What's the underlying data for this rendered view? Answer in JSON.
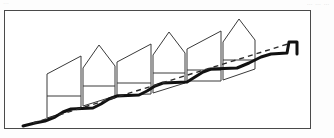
{
  "page": {
    "header_note": "…  … …",
    "corner_mark": "…",
    "background_color": "#fdfdfd"
  },
  "figure": {
    "frame": {
      "x": 4,
      "y": 10,
      "width": 307,
      "height": 119,
      "border_color": "#4a4a4a",
      "border_width": 1,
      "fill": "#ffffff"
    },
    "colors": {
      "outline": "#3a3a3a",
      "terrain": "#111111",
      "dashed_line": "#2b2b2b",
      "fill": "#ffffff"
    },
    "terrain": {
      "name": "ground-profile",
      "description": "Stepped hillside rising from lower-left to upper-right",
      "stroke_width": 3,
      "points": [
        [
          18,
          115
        ],
        [
          30,
          112
        ],
        [
          40,
          110
        ],
        [
          50,
          106
        ],
        [
          58,
          101
        ],
        [
          66,
          98
        ],
        [
          88,
          97
        ],
        [
          96,
          93
        ],
        [
          104,
          88
        ],
        [
          112,
          85
        ],
        [
          134,
          84
        ],
        [
          142,
          80
        ],
        [
          150,
          75
        ],
        [
          158,
          72
        ],
        [
          182,
          71
        ],
        [
          190,
          66
        ],
        [
          198,
          61
        ],
        [
          206,
          58
        ],
        [
          232,
          57
        ],
        [
          244,
          52
        ],
        [
          256,
          46
        ],
        [
          266,
          43
        ],
        [
          282,
          42
        ],
        [
          284,
          31
        ],
        [
          292,
          31
        ],
        [
          292,
          43
        ]
      ]
    },
    "trend_line": {
      "name": "dashed-trend-line",
      "description": "Dashed straight line from lower-left ground to upper-right wall top",
      "start": [
        28,
        112
      ],
      "end": [
        286,
        32
      ],
      "dash_pattern": "5 4",
      "stroke_width": 1.4
    },
    "buildings": [
      {
        "id": "building-1",
        "label": "Unit 1",
        "shape": "shed-slope",
        "outline": [
          [
            42,
            107
          ],
          [
            42,
            63
          ],
          [
            76,
            45
          ],
          [
            76,
            96
          ]
        ],
        "floor_lines": [
          [
            [
              42,
              85
            ],
            [
              76,
              85
            ]
          ]
        ]
      },
      {
        "id": "building-2",
        "label": "Unit 2",
        "shape": "gable-peak",
        "outline": [
          [
            78,
            95
          ],
          [
            78,
            57
          ],
          [
            94,
            34
          ],
          [
            110,
            55
          ],
          [
            110,
            85
          ]
        ],
        "floor_lines": [
          [
            [
              78,
              75
            ],
            [
              110,
              75
            ]
          ]
        ]
      },
      {
        "id": "building-3",
        "label": "Unit 3",
        "shape": "shed-slope",
        "outline": [
          [
            112,
            84
          ],
          [
            112,
            51
          ],
          [
            146,
            33
          ],
          [
            146,
            83
          ]
        ],
        "floor_lines": [
          [
            [
              112,
              72
            ],
            [
              146,
              72
            ]
          ]
        ]
      },
      {
        "id": "building-4",
        "label": "Unit 4",
        "shape": "gable-peak",
        "outline": [
          [
            148,
            82
          ],
          [
            148,
            44
          ],
          [
            164,
            21
          ],
          [
            180,
            42
          ],
          [
            180,
            72
          ]
        ],
        "floor_lines": [
          [
            [
              148,
              62
            ],
            [
              180,
              62
            ]
          ]
        ]
      },
      {
        "id": "building-5",
        "label": "Unit 5",
        "shape": "shed-slope",
        "outline": [
          [
            182,
            70
          ],
          [
            182,
            38
          ],
          [
            216,
            20
          ],
          [
            216,
            70
          ]
        ],
        "floor_lines": [
          [
            [
              182,
              59
            ],
            [
              216,
              59
            ]
          ]
        ]
      },
      {
        "id": "building-6",
        "label": "Unit 6",
        "shape": "gable-peak",
        "outline": [
          [
            218,
            69
          ],
          [
            218,
            31
          ],
          [
            234,
            8
          ],
          [
            250,
            29
          ],
          [
            250,
            58
          ]
        ],
        "floor_lines": [
          [
            [
              218,
              49
            ],
            [
              250,
              49
            ]
          ]
        ]
      }
    ]
  }
}
